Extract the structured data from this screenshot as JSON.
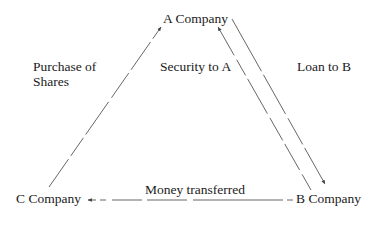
{
  "nodes": {
    "a": {
      "label": "A Company"
    },
    "b": {
      "label": "B Company"
    },
    "c": {
      "label": "C Company"
    }
  },
  "edges": [
    {
      "from": "C Company",
      "to": "A Company",
      "label": "Purchase of Shares",
      "style": "dashed"
    },
    {
      "from": "B Company",
      "to": "A Company",
      "label": "Security to A",
      "style": "dashed"
    },
    {
      "from": "A Company",
      "to": "B Company",
      "label": "Loan to B",
      "style": "dashed"
    },
    {
      "from": "B Company",
      "to": "C Company",
      "label": "Money transferred",
      "style": "dashed"
    }
  ],
  "labels": {
    "purchase_line1": "Purchase of",
    "purchase_line2": "Shares",
    "security": "Security to A",
    "loan": "Loan to B",
    "money": "Money transferred"
  },
  "colors": {
    "line": "#444444",
    "text": "#1a1a1a",
    "background": "#ffffff"
  }
}
